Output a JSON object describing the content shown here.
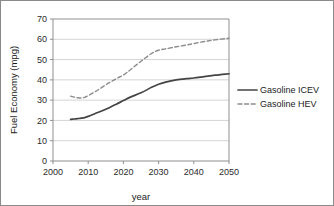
{
  "chart_data": {
    "type": "line",
    "title": "",
    "xlabel": "year",
    "ylabel": "Fuel Economy (mpg)",
    "xlim": [
      2000,
      2050
    ],
    "ylim": [
      0,
      70
    ],
    "xticks": [
      2000,
      2010,
      2020,
      2030,
      2040,
      2050
    ],
    "xtick_labels": [
      "2000",
      "2010",
      "2020",
      "2030",
      "2040",
      "2050"
    ],
    "yticks": [
      0,
      10,
      20,
      30,
      40,
      50,
      60,
      70
    ],
    "ytick_labels": [
      "0",
      "10",
      "20",
      "30",
      "40",
      "50",
      "60",
      "70"
    ],
    "grid": "horizontal",
    "legend_position": "right-outside",
    "x": [
      2005,
      2006,
      2007,
      2008,
      2009,
      2010,
      2012,
      2014,
      2016,
      2018,
      2020,
      2022,
      2025,
      2028,
      2030,
      2032,
      2035,
      2038,
      2040,
      2043,
      2046,
      2050
    ],
    "series": [
      {
        "name": "Gasoline ICEV",
        "style": "solid",
        "color": "#444444",
        "values": [
          20.5,
          20.7,
          20.9,
          21.1,
          21.4,
          22.0,
          23.4,
          24.8,
          26.3,
          28.0,
          29.8,
          31.5,
          33.6,
          36.3,
          37.8,
          38.9,
          40.0,
          40.6,
          40.9,
          41.6,
          42.3,
          43.0
        ]
      },
      {
        "name": "Gasoline HEV",
        "style": "dashed",
        "color": "#8c8c8c",
        "values": [
          32.0,
          31.5,
          31.2,
          31.1,
          31.4,
          32.2,
          34.2,
          36.4,
          38.6,
          40.6,
          42.4,
          45.0,
          49.2,
          53.0,
          54.6,
          55.3,
          56.3,
          57.2,
          57.9,
          58.9,
          59.7,
          60.5
        ]
      }
    ]
  },
  "legend": {
    "items": [
      {
        "label": "Gasoline ICEV"
      },
      {
        "label": "Gasoline HEV"
      }
    ]
  }
}
